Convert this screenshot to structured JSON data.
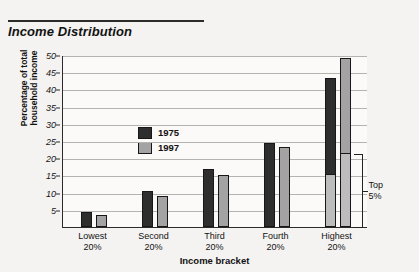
{
  "header": {
    "cropped_top_text": "",
    "title": "Income Distribution"
  },
  "legend": {
    "items": [
      {
        "label": "1975",
        "color": "#2e2e2e"
      },
      {
        "label": "1997",
        "color": "#a3a3a3"
      }
    ]
  },
  "annotation": {
    "top_line": "Top",
    "bottom_line": "5%"
  },
  "chart_data": {
    "type": "bar",
    "title": "Income Distribution",
    "xlabel": "Income bracket",
    "ylabel": "Percentage of total household income",
    "ylabel_lines": [
      "Percentage of total",
      "household income"
    ],
    "categories": [
      "Lowest 20%",
      "Second 20%",
      "Third 20%",
      "Fourth 20%",
      "Highest 20%"
    ],
    "category_lines": [
      [
        "Lowest",
        "20%"
      ],
      [
        "Second",
        "20%"
      ],
      [
        "Third",
        "20%"
      ],
      [
        "Fourth",
        "20%"
      ],
      [
        "Highest",
        "20%"
      ]
    ],
    "series": [
      {
        "name": "1975",
        "color": "#2e2e2e",
        "values": [
          4.4,
          10.4,
          17.0,
          24.5,
          43.2
        ]
      },
      {
        "name": "1997",
        "color": "#a3a3a3",
        "values": [
          3.6,
          8.9,
          15.0,
          23.2,
          49.0
        ]
      }
    ],
    "top5_segment": {
      "label": "Top 5%",
      "color": "#bdbdbd",
      "values_1975": 15.5,
      "values_1997": 21.5,
      "applies_to_category": "Highest 20%"
    },
    "ylim": [
      0,
      50
    ],
    "yticks": [
      5,
      10,
      15,
      20,
      25,
      30,
      35,
      40,
      45,
      50
    ],
    "grid": true,
    "legend_position": "upper-left-inside"
  }
}
